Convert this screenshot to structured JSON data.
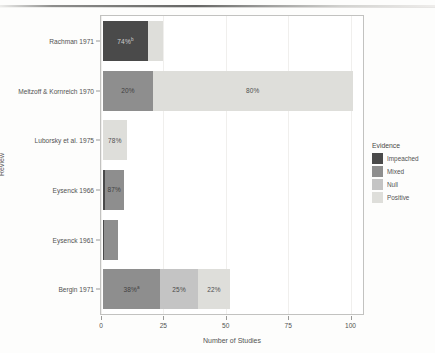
{
  "chart_data": {
    "type": "bar",
    "orientation": "horizontal",
    "stacked": true,
    "title": "",
    "xlabel": "Number of Studies",
    "ylabel": "Review",
    "xlim": [
      0,
      105
    ],
    "xticks": [
      0,
      25,
      50,
      75,
      100
    ],
    "xtick_labels": [
      "0",
      "25",
      "50",
      "75",
      "100"
    ],
    "grid": false,
    "legend": {
      "title": "Evidence",
      "position": "right",
      "entries": [
        "Impeached",
        "Mixed",
        "Null",
        "Positive"
      ]
    },
    "categories": [
      "Bergin 1971",
      "Eysenck 1961",
      "Eysenck 1966",
      "Luborsky et al. 1975",
      "Meltzoff & Kornreich 1970",
      "Rachman 1971"
    ],
    "series": [
      {
        "name": "Impeached",
        "color": "#4a4a4a",
        "values": [
          0,
          0.6,
          0.7,
          0,
          0,
          18
        ]
      },
      {
        "name": "Mixed",
        "color": "#8e8e8e",
        "values": [
          23,
          5.4,
          7.6,
          0,
          20,
          0
        ]
      },
      {
        "name": "Null",
        "color": "#c4c4c4",
        "values": [
          15,
          0,
          0,
          0,
          0,
          0
        ]
      },
      {
        "name": "Positive",
        "color": "#dededa",
        "values": [
          13,
          0,
          0,
          9.5,
          80,
          6
        ]
      }
    ],
    "bars": [
      {
        "review": "Rachman 1971",
        "segments": [
          {
            "evidence": "Impeached",
            "value": 18,
            "label": "74%",
            "superscript": "b"
          },
          {
            "evidence": "Positive",
            "value": 6,
            "label": ""
          }
        ]
      },
      {
        "review": "Meltzoff & Kornreich 1970",
        "segments": [
          {
            "evidence": "Mixed",
            "value": 20,
            "label": "20%",
            "superscript": ""
          },
          {
            "evidence": "Positive",
            "value": 80,
            "label": "80%",
            "superscript": ""
          }
        ]
      },
      {
        "review": "Luborsky et al. 1975",
        "segments": [
          {
            "evidence": "Positive",
            "value": 9.5,
            "label": "78%",
            "superscript": ""
          }
        ]
      },
      {
        "review": "Eysenck 1966",
        "segments": [
          {
            "evidence": "Impeached",
            "value": 0.7,
            "label": "",
            "superscript": ""
          },
          {
            "evidence": "Mixed",
            "value": 7.6,
            "label": "87%",
            "superscript": ""
          }
        ]
      },
      {
        "review": "Eysenck 1961",
        "segments": [
          {
            "evidence": "Impeached",
            "value": 0.6,
            "label": "",
            "superscript": ""
          },
          {
            "evidence": "Mixed",
            "value": 5.4,
            "label": "",
            "superscript": ""
          }
        ]
      },
      {
        "review": "Bergin 1971",
        "segments": [
          {
            "evidence": "Mixed",
            "value": 23,
            "label": "38%",
            "superscript": "a"
          },
          {
            "evidence": "Null",
            "value": 15,
            "label": "25%",
            "superscript": ""
          },
          {
            "evidence": "Positive",
            "value": 13,
            "label": "22%",
            "superscript": ""
          }
        ]
      }
    ]
  },
  "axes": {
    "y_title": "Review",
    "x_title": "Number of Studies",
    "y_categories": [
      "Rachman 1971",
      "Meltzoff & Kornreich 1970",
      "Luborsky et al. 1975",
      "Eysenck 1966",
      "Eysenck 1961",
      "Bergin 1971"
    ],
    "x_tick_labels": [
      "0",
      "25",
      "50",
      "75",
      "100"
    ]
  },
  "legend": {
    "title": "Evidence",
    "items": [
      {
        "label": "Impeached",
        "color": "#4a4a4a"
      },
      {
        "label": "Mixed",
        "color": "#8e8e8e"
      },
      {
        "label": "Null",
        "color": "#c4c4c4"
      },
      {
        "label": "Positive",
        "color": "#dededa"
      }
    ]
  }
}
